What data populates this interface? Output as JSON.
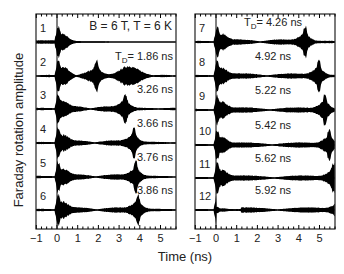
{
  "chart_data": {
    "type": "line",
    "title": "",
    "annotation": "B = 6 T, T = 6 K",
    "xlabel": "Time (ns)",
    "ylabel": "Faraday rotation amplitude",
    "xlim": [
      -1,
      5.75
    ],
    "xticks": [
      -1,
      0,
      1,
      2,
      3,
      4,
      5
    ],
    "xtick_labels": [
      "−1",
      "0",
      "1",
      "2",
      "3",
      "4",
      "5"
    ],
    "grid": false,
    "legend": "none",
    "panels": [
      {
        "name": "left",
        "traces": [
          {
            "index": "1",
            "delay_label": "",
            "delay_ns": null
          },
          {
            "index": "2",
            "delay_label": "T_D= 1.86 ns",
            "delay_ns": 1.86
          },
          {
            "index": "3",
            "delay_label": "3.26 ns",
            "delay_ns": 3.26
          },
          {
            "index": "4",
            "delay_label": "3.66 ns",
            "delay_ns": 3.66
          },
          {
            "index": "5",
            "delay_label": "3.76 ns",
            "delay_ns": 3.76
          },
          {
            "index": "6",
            "delay_label": "3.86 ns",
            "delay_ns": 3.86
          }
        ]
      },
      {
        "name": "right",
        "traces": [
          {
            "index": "7",
            "delay_label": "T_D = 4.26 ns",
            "delay_ns": 4.26
          },
          {
            "index": "8",
            "delay_label": "4.92 ns",
            "delay_ns": 4.92
          },
          {
            "index": "9",
            "delay_label": "5.22 ns",
            "delay_ns": 5.22
          },
          {
            "index": "10",
            "delay_label": "5.42 ns",
            "delay_ns": 5.42
          },
          {
            "index": "11",
            "delay_label": "5.62 ns",
            "delay_ns": 5.62
          },
          {
            "index": "12",
            "delay_label": "5.92 ns",
            "delay_ns": 5.92
          }
        ]
      }
    ]
  },
  "labels": {
    "annotation": "B = 6 T, T = 6 K",
    "xlabel": "Time (ns)",
    "ylabel": "Faraday rotation amplitude",
    "td_prefix": "T",
    "td_sub": "D"
  },
  "colors": {
    "trace": "#000000",
    "frame": "#222222",
    "background": "#ffffff"
  }
}
